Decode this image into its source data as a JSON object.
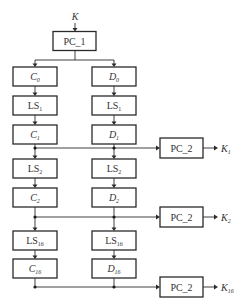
{
  "diagram": {
    "input": {
      "label": "K"
    },
    "pc1": {
      "label": "PC_1"
    },
    "left_column": [
      {
        "base": "C",
        "sub": "0",
        "italic": true
      },
      {
        "base": "LS",
        "sub": "1",
        "italic": false
      },
      {
        "base": "C",
        "sub": "1",
        "italic": true
      },
      {
        "base": "LS",
        "sub": "2",
        "italic": false
      },
      {
        "base": "C",
        "sub": "2",
        "italic": true
      },
      {
        "base": "LS",
        "sub": "16",
        "italic": false
      },
      {
        "base": "C",
        "sub": "16",
        "italic": true
      }
    ],
    "right_column": [
      {
        "base": "D",
        "sub": "0",
        "italic": true
      },
      {
        "base": "LS",
        "sub": "1",
        "italic": false
      },
      {
        "base": "D",
        "sub": "1",
        "italic": true
      },
      {
        "base": "LS",
        "sub": "2",
        "italic": false
      },
      {
        "base": "D",
        "sub": "2",
        "italic": true
      },
      {
        "base": "LS",
        "sub": "16",
        "italic": false
      },
      {
        "base": "D",
        "sub": "16",
        "italic": true
      }
    ],
    "pc2_blocks": [
      {
        "label": "PC_2",
        "output_base": "K",
        "output_sub": "1"
      },
      {
        "label": "PC_2",
        "output_base": "K",
        "output_sub": "2"
      },
      {
        "label": "PC_2",
        "output_base": "K",
        "output_sub": "16"
      }
    ]
  }
}
